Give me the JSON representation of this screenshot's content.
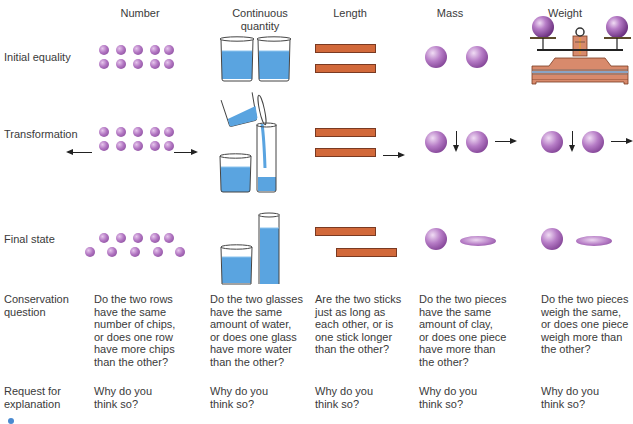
{
  "columns": [
    {
      "id": "number",
      "label": "Number"
    },
    {
      "id": "continuous",
      "label_line1": "Continuous",
      "label_line2": "quantity"
    },
    {
      "id": "length",
      "label": "Length"
    },
    {
      "id": "mass",
      "label": "Mass"
    },
    {
      "id": "weight",
      "label": "Weight"
    }
  ],
  "rows": {
    "initial": "Initial equality",
    "transformation": "Transformation",
    "final": "Final state",
    "question_line1": "Conservation",
    "question_line2": "question",
    "request_line1": "Request for",
    "request_line2": "explanation"
  },
  "questions": {
    "number": [
      "Do the two rows",
      "have the same",
      "number of chips,",
      "or does one row",
      "have more chips",
      "than the other?"
    ],
    "continuous": [
      "Do the two glasses",
      "have the same",
      "amount of water,",
      "or does one glass",
      "have more water",
      "than the other?"
    ],
    "length": [
      "Are the two sticks",
      "just as long as",
      "each other, or is",
      "one stick longer",
      "than the other?"
    ],
    "mass": [
      "Do the two pieces",
      "have the same",
      "amount of clay,",
      "or does one piece",
      "have more than",
      "the other?"
    ],
    "weight": [
      "Do the two pieces",
      "weigh the same,",
      "or does one piece",
      "weigh more than",
      "the other?"
    ]
  },
  "explanations": {
    "number": [
      "Why do you",
      "think so?"
    ],
    "continuous": [
      "Why do you",
      "think so?"
    ],
    "length": [
      "Why do you",
      "think so?"
    ],
    "mass": [
      "Why do you",
      "think so?"
    ],
    "weight": [
      "Why do you",
      "think so?"
    ]
  },
  "colors": {
    "chip": "#a466b6",
    "water": "#5aa4e0",
    "stick": "#d2693a",
    "scale": "#d88a6c"
  }
}
